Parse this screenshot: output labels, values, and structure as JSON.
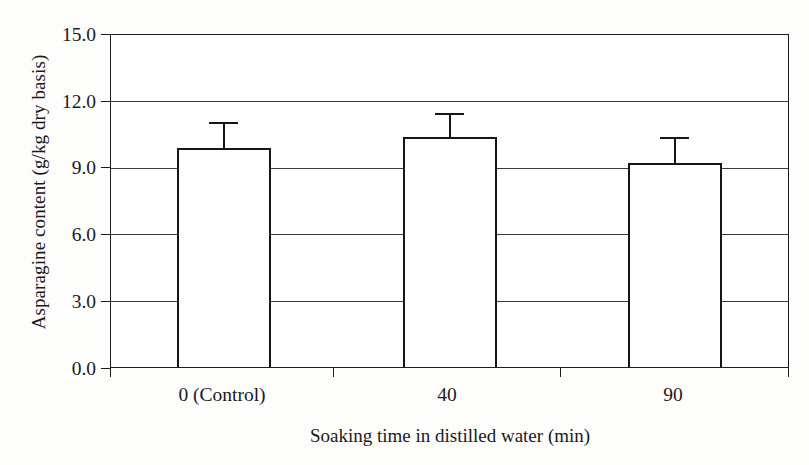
{
  "chart_data": {
    "type": "bar",
    "title": "",
    "subtitle": "",
    "xlabel": "Soaking time in distilled water (min)",
    "ylabel": "Asparagine content (g/kg dry basis)",
    "categories": [
      "0 (Control)",
      "40",
      "90"
    ],
    "values": [
      9.9,
      10.4,
      9.2
    ],
    "errors_upper": [
      1.1,
      1.0,
      1.1
    ],
    "series": [
      {
        "name": "Asparagine content",
        "values": [
          9.9,
          10.4,
          9.2
        ],
        "errors_upper": [
          1.1,
          1.0,
          1.1
        ]
      }
    ],
    "ylim": [
      0.0,
      15.0
    ],
    "ytick_values": [
      0.0,
      3.0,
      6.0,
      9.0,
      12.0,
      15.0
    ],
    "ytick_labels": [
      "0.0",
      "3.0",
      "6.0",
      "9.0",
      "12.0",
      "15.0"
    ],
    "grid": "horizontal",
    "legend": "none",
    "bar_fill_color": "#ffffff",
    "bar_edge_color": "#161616",
    "gridline_color": "#3a3a3a",
    "frame_color": "#1c1c1c",
    "background_color": "#fdfdfc",
    "error_bar_style": "upper-cap-only",
    "annotations": []
  }
}
